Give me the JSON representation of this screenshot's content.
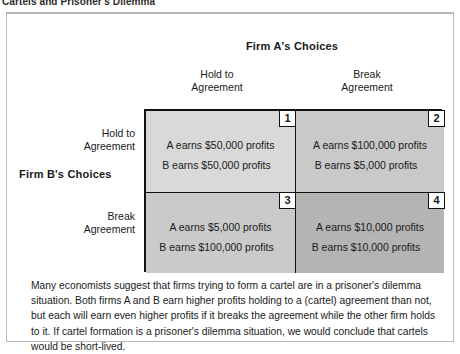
{
  "caption": {
    "text": "Cartels and Prisoner's Dilemma"
  },
  "matrix": {
    "column_axis_title": "Firm A's Choices",
    "row_axis_title": "Firm B's Choices",
    "column_headers": [
      {
        "line1": "Hold to",
        "line2": "Agreement"
      },
      {
        "line1": "Break",
        "line2": "Agreement"
      }
    ],
    "row_headers": [
      {
        "line1": "Hold to",
        "line2": "Agreement"
      },
      {
        "line1": "Break",
        "line2": "Agreement"
      }
    ],
    "cells": [
      {
        "number": "1",
        "firm_a_payoff": "A earns $50,000 profits",
        "firm_b_payoff": "B earns $50,000 profits",
        "shade": "#d9d9d9"
      },
      {
        "number": "2",
        "firm_a_payoff": "A earns $100,000 profits",
        "firm_b_payoff": "B earns $5,000 profits",
        "shade": "#c9c9c9"
      },
      {
        "number": "3",
        "firm_a_payoff": "A earns $5,000 profits",
        "firm_b_payoff": "B earns $100,000 profits",
        "shade": "#cacaca"
      },
      {
        "number": "4",
        "firm_a_payoff": "A earns $10,000 profits",
        "firm_b_payoff": "B earns $10,000 profits",
        "shade": "#b4b4b4"
      }
    ]
  },
  "explanation": {
    "text": "Many economists suggest that firms trying to form a cartel are in a prisoner's dilemma situation. Both firms A and B earn higher profits holding to a (cartel) agreement than not, but each will earn even higher profits if it breaks the agreement while the other firm holds to it. If cartel formation is a prisoner's dilemma situation, we would conclude that cartels would be short-lived."
  }
}
